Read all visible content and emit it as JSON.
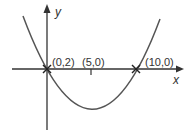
{
  "diagram": {
    "type": "parabola-graph",
    "axes": {
      "x_label": "x",
      "y_label": "y"
    },
    "points": [
      {
        "label": "(0,2)",
        "marker": "cross"
      },
      {
        "label": "(5,0)",
        "marker": "tick"
      },
      {
        "label": "(10,0)",
        "marker": "cross"
      }
    ],
    "colors": {
      "curve": "#555555",
      "axis": "#333333",
      "text": "#333333"
    }
  }
}
